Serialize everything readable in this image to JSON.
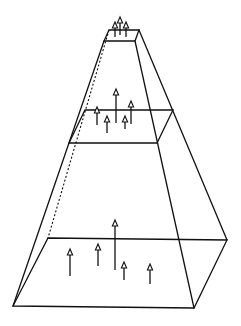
{
  "diagram": {
    "colors": {
      "stroke": "#111111",
      "background": "#ffffff"
    },
    "planes": [
      {
        "name": "top-platform",
        "corners": {
          "back_left": [
            109,
            30
          ],
          "back_right": [
            139,
            30
          ],
          "front_right": [
            135,
            41
          ],
          "front_left": [
            104,
            41
          ]
        },
        "arrows": [
          {
            "x": 115,
            "base": 37,
            "tip": 22
          },
          {
            "x": 120,
            "base": 35,
            "tip": 17
          },
          {
            "x": 126,
            "base": 37,
            "tip": 22
          }
        ]
      },
      {
        "name": "middle-plane",
        "corners": {
          "back_left": [
            85,
            110
          ],
          "back_right": [
            173,
            110
          ],
          "front_right": [
            157,
            143
          ],
          "front_left": [
            69,
            143
          ]
        },
        "arrows": [
          {
            "x": 97,
            "base": 125,
            "tip": 107
          },
          {
            "x": 107,
            "base": 133,
            "tip": 116
          },
          {
            "x": 116,
            "base": 123,
            "tip": 89
          },
          {
            "x": 125,
            "base": 129,
            "tip": 116
          },
          {
            "x": 131,
            "base": 124,
            "tip": 101
          }
        ]
      },
      {
        "name": "bottom-plane",
        "corners": {
          "back_left": [
            48,
            238
          ],
          "back_right": [
            227,
            240
          ],
          "front_right": [
            194,
            308
          ],
          "front_left": [
            13,
            306
          ]
        },
        "arrows": [
          {
            "x": 70,
            "base": 276,
            "tip": 249
          },
          {
            "x": 98,
            "base": 266,
            "tip": 244
          },
          {
            "x": 115,
            "base": 270,
            "tip": 220
          },
          {
            "x": 124,
            "base": 280,
            "tip": 262
          },
          {
            "x": 150,
            "base": 284,
            "tip": 264
          }
        ]
      }
    ],
    "lateral_edges": {
      "back_left_hidden": [
        [
          109,
          30
        ],
        [
          48,
          238
        ]
      ],
      "front_left": [
        [
          104,
          41
        ],
        [
          13,
          306
        ]
      ],
      "front_right": [
        [
          135,
          41
        ],
        [
          194,
          308
        ]
      ],
      "back_right": [
        [
          139,
          30
        ],
        [
          227,
          240
        ]
      ]
    }
  }
}
